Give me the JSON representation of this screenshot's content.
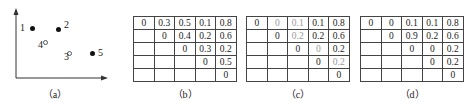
{
  "panel_a": {
    "caption": "（a）",
    "points": [
      {
        "label": "1",
        "x": 32,
        "y": 28,
        "filled": true
      },
      {
        "label": "2",
        "x": 58,
        "y": 29,
        "filled": true
      },
      {
        "label": "3",
        "x": 69,
        "y": 53,
        "filled": false
      },
      {
        "label": "4",
        "x": 45,
        "y": 42,
        "filled": false
      },
      {
        "label": "5",
        "x": 92,
        "y": 53,
        "filled": true
      }
    ]
  },
  "panel_b": {
    "caption": "（b）",
    "rows": [
      [
        "0",
        "0.3",
        "0.5",
        "0.1",
        "0.8"
      ],
      [
        "",
        "0",
        "0.4",
        "0.2",
        "0.6"
      ],
      [
        "",
        "",
        "0",
        "0.3",
        "0.2"
      ],
      [
        "",
        "",
        "",
        "0",
        "0.5"
      ],
      [
        "",
        "",
        "",
        "",
        "0"
      ]
    ]
  },
  "panel_c": {
    "caption": "（c）",
    "rows": [
      [
        "0",
        "0",
        "0.1",
        "0.1",
        "0.8"
      ],
      [
        "",
        "0",
        "0.2",
        "0.2",
        "0.6"
      ],
      [
        "",
        "",
        "0",
        "0",
        "0.2"
      ],
      [
        "",
        "",
        "",
        "0",
        "0.2"
      ],
      [
        "",
        "",
        "",
        "",
        "0"
      ]
    ],
    "gray_cells": [
      [
        0,
        1
      ],
      [
        0,
        2
      ],
      [
        1,
        2
      ],
      [
        2,
        3
      ],
      [
        3,
        4
      ]
    ]
  },
  "panel_d": {
    "caption": "（d）",
    "rows": [
      [
        "0",
        "0",
        "0.1",
        "0.1",
        "0.8"
      ],
      [
        "",
        "0",
        "0.9",
        "0.2",
        "0.6"
      ],
      [
        "",
        "",
        "0",
        "0",
        "0.2"
      ],
      [
        "",
        "",
        "",
        "0",
        "0.2"
      ],
      [
        "",
        "",
        "",
        "",
        "0"
      ]
    ]
  }
}
